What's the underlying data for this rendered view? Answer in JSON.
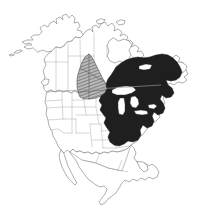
{
  "figure": {
    "background_color": "#ffffff",
    "width": 205,
    "height": 221
  },
  "map": {
    "projection_region": "North America",
    "coastline_color": "#8d8d8d",
    "internal_border_color": "#b4b4b4",
    "country_border_color": "#9a9a9a",
    "landmasses": [
      "Alaska",
      "Canada",
      "Contiguous United States",
      "Mexico",
      "Central America",
      "Newfoundland",
      "Vancouver Island",
      "Baja California"
    ],
    "water_features": [
      "Hudson Bay",
      "Great Lakes",
      "Gulf of Mexico",
      "Gulf of California"
    ]
  },
  "legend": {
    "ranges": [
      {
        "id": "core-range",
        "label": "Primary range",
        "fill_style": "solid-dark",
        "color": "#1f1f1f",
        "region_description": "Eastern North America: Great Lakes, Northeastern United States, Appalachians, southeastern Canada, Quebec, Labrador"
      },
      {
        "id": "secondary-range",
        "label": "Secondary range",
        "fill_style": "diagonal-hatch",
        "color": "#707070",
        "region_description": "Northern Great Plains: Alberta, Saskatchewan, Montana, North Dakota"
      }
    ]
  },
  "annotations": {
    "caption": "",
    "scale_bar": "",
    "north_arrow": ""
  }
}
